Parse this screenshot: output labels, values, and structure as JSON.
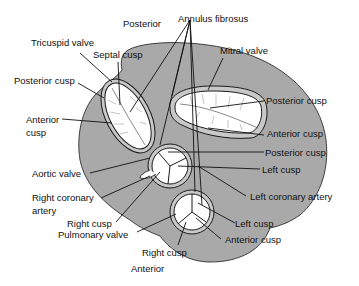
{
  "diagram": {
    "colors": {
      "tissue": "#a9a9a9",
      "valve": "#ffffff",
      "outline": "#1a1a1a",
      "text": "#111111"
    },
    "labels": {
      "posterior": "Posterior",
      "annulus_fibrosus": "Annulus fibrosus",
      "tricuspid_valve": "Tricuspid valve",
      "septal_cusp": "Septal cusp",
      "mitral_valve": "Mitral valve",
      "tri_posterior_cusp": "Posterior cusp",
      "tri_anterior_cusp_1": "Anterior",
      "tri_anterior_cusp_2": "cusp",
      "mitral_posterior_cusp": "Posterior cusp",
      "mitral_anterior_cusp": "Anterior cusp",
      "aortic_valve": "Aortic valve",
      "aortic_posterior_cusp": "Posterior cusp",
      "aortic_left_cusp": "Left cusp",
      "right_coronary_artery_1": "Right coronary",
      "right_coronary_artery_2": "artery",
      "left_coronary_artery": "Left coronary artery",
      "aortic_right_cusp": "Right cusp",
      "pulmonary_valve": "Pulmonary valve",
      "pulmonary_left_cusp": "Left cusp",
      "pulmonary_anterior_cusp": "Anterior cusp",
      "pulmonary_right_cusp": "Right cusp",
      "anterior": "Anterior"
    }
  }
}
